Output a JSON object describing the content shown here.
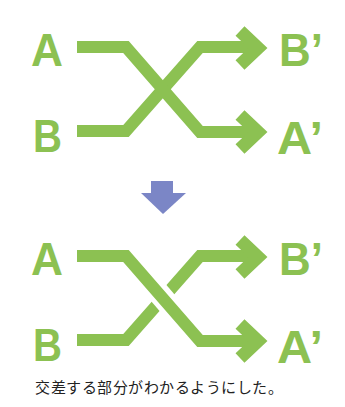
{
  "colors": {
    "path": "#8cc152",
    "arrow_down": "#7b86c6",
    "caption": "#222222",
    "background": "#ffffff"
  },
  "diagram_before": {
    "labels": {
      "left_top": "A",
      "left_bottom": "B",
      "right_top": "B’",
      "right_bottom": "A’"
    },
    "crossing_style": "flat-overlap"
  },
  "transition_arrow": {
    "icon": "down-arrow-icon"
  },
  "diagram_after": {
    "labels": {
      "left_top": "A",
      "left_bottom": "B",
      "right_top": "B’",
      "right_bottom": "A’"
    },
    "crossing_style": "over-under-gap"
  },
  "caption": "交差する部分がわかるようにした。"
}
